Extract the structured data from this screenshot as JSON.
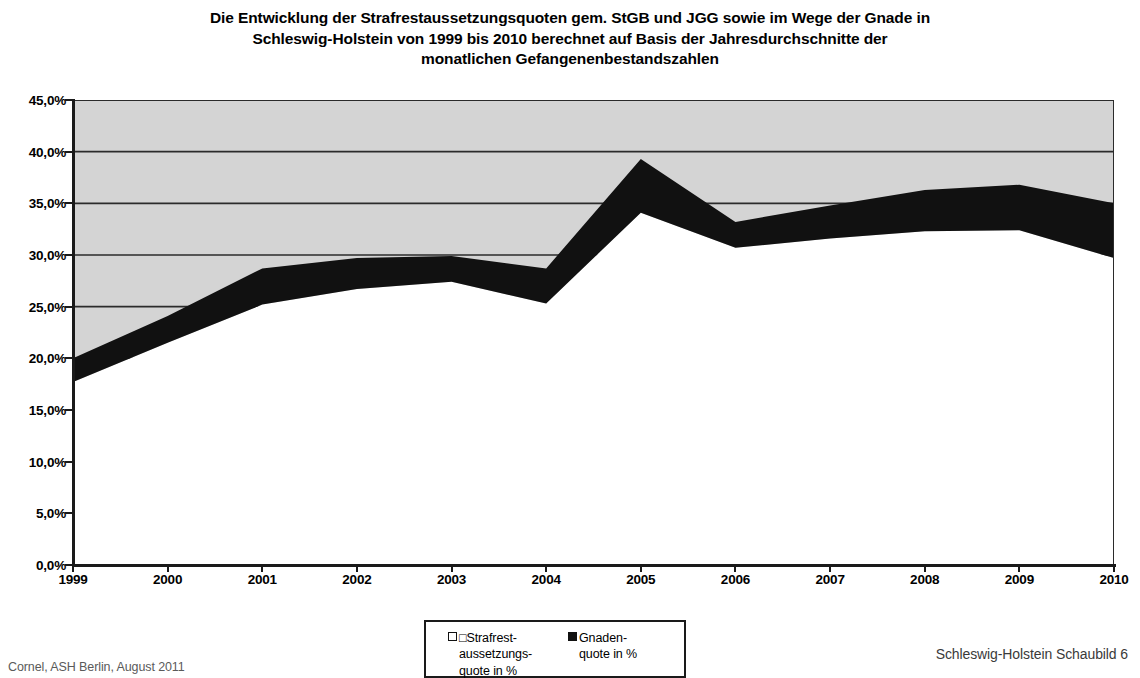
{
  "chart_data": {
    "type": "area",
    "stacked": true,
    "title_lines": [
      "Die Entwicklung der Strafrestaussetzungsquoten gem. StGB und JGG sowie im Wege der Gnade in",
      "Schleswig-Holstein von 1999 bis 2010 berechnet auf Basis der Jahresdurchschnitte der",
      "monatlichen Gefangenenbestandszahlen"
    ],
    "categories": [
      "1999",
      "2000",
      "2001",
      "2002",
      "2003",
      "2004",
      "2005",
      "2006",
      "2007",
      "2008",
      "2009",
      "2010"
    ],
    "series": [
      {
        "name": "Strafrestaussetzungsquote in %",
        "color": "#ffffff",
        "values": [
          17.7,
          21.5,
          25.2,
          26.7,
          27.4,
          25.3,
          34.1,
          30.7,
          31.6,
          32.3,
          32.4,
          29.7
        ]
      },
      {
        "name": "Gnadenquote in %",
        "color": "#111111",
        "values": [
          2.3,
          2.6,
          3.5,
          3.0,
          2.5,
          3.4,
          5.2,
          2.5,
          3.2,
          4.0,
          4.4,
          5.3
        ]
      }
    ],
    "series_totals": [
      20.0,
      24.1,
      28.7,
      29.7,
      29.9,
      28.7,
      39.3,
      33.2,
      34.8,
      36.3,
      36.8,
      35.0
    ],
    "xlabel": "",
    "ylabel": "",
    "ylim": [
      0,
      45
    ],
    "y_ticks": [
      "0,0%",
      "5,0%",
      "10,0%",
      "15,0%",
      "20,0%",
      "25,0%",
      "30,0%",
      "35,0%",
      "40,0%",
      "45,0%"
    ],
    "y_tick_values": [
      0,
      5,
      10,
      15,
      20,
      25,
      30,
      35,
      40,
      45
    ],
    "grid": true,
    "grid_color": "#2b2b2b",
    "plot_background": "#d4d4d4",
    "legend_position": "bottom-center"
  },
  "legend": {
    "entries": [
      {
        "marker": "light-square-marker",
        "line1": "□Strafrest-",
        "line2": "aussetzungs-",
        "line3": "quote in %"
      },
      {
        "marker": "dark-square-marker",
        "line1": "Gnaden-",
        "line2": "quote in %",
        "line3": ""
      }
    ]
  },
  "footer": {
    "left": "Cornel, ASH Berlin, August 2011",
    "right": "Schleswig-Holstein Schaubild 6"
  }
}
